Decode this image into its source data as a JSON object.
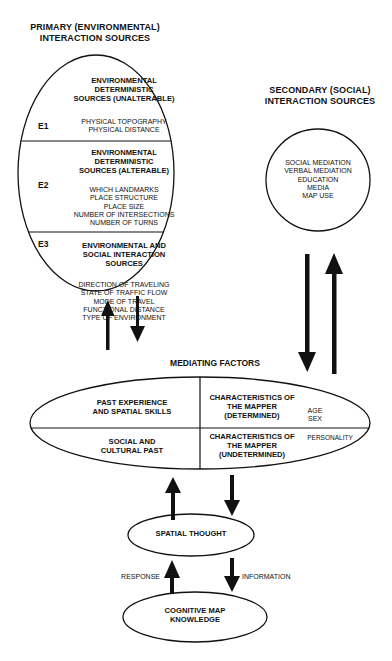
{
  "primary": {
    "title_line1": "PRIMARY (ENVIRONMENTAL)",
    "title_line2": "INTERACTION SOURCES",
    "sections": [
      {
        "id": "E1",
        "heading": [
          "ENVIRONMENTAL",
          "DETERMINISTIC",
          "SOURCES (UNALTERABLE)"
        ],
        "items": [
          "PHYSICAL TOPOGRAPHY",
          "PHYSICAL DISTANCE"
        ]
      },
      {
        "id": "E2",
        "heading": [
          "ENVIRONMENTAL",
          "DETERMINISTIC",
          "SOURCES (ALTERABLE)"
        ],
        "items": [
          "WHICH LANDMARKS",
          "PLACE STRUCTURE",
          "PLACE SIZE",
          "NUMBER OF INTERSECTIONS",
          "NUMBER OF TURNS"
        ]
      },
      {
        "id": "E3",
        "heading": [
          "ENVIRONMENTAL AND",
          "SOCIAL INTERACTION",
          "SOURCES"
        ],
        "items": [
          "DIRECTION OF TRAVELING",
          "STATE OF TRAFFIC FLOW",
          "MODE OF TRAVEL",
          "FUNCTIONAL DISTANCE",
          "TYPE OF ENVIRONMENT"
        ]
      }
    ]
  },
  "secondary": {
    "title_line1": "SECONDARY (SOCIAL)",
    "title_line2": "INTERACTION SOURCES",
    "items": [
      "SOCIAL MEDIATION",
      "VERBAL MEDIATION",
      "EDUCATION",
      "MEDIA",
      "MAP USE"
    ]
  },
  "mediating": {
    "title": "MEDIATING FACTORS",
    "quadrants": {
      "top_left": [
        "PAST EXPERIENCE",
        "AND SPATIAL SKILLS"
      ],
      "bottom_left": [
        "SOCIAL AND",
        "CULTURAL PAST"
      ],
      "top_right": [
        "CHARACTERISTICS OF",
        "THE MAPPER",
        "(DETERMINED)"
      ],
      "top_right_items": [
        "AGE",
        "SEX"
      ],
      "bottom_right": [
        "CHARACTERISTICS OF",
        "THE MAPPER",
        "(UNDETERMINED)"
      ],
      "bottom_right_items": [
        "PERSONALITY"
      ]
    }
  },
  "spatial_thought": {
    "label": "SPATIAL THOUGHT"
  },
  "cognitive_map": {
    "line1": "COGNITIVE MAP",
    "line2": "KNOWLEDGE"
  },
  "arrow_labels": {
    "response": "RESPONSE",
    "information": "INFORMATION"
  },
  "colors": {
    "ink": "#111111",
    "background": "#ffffff"
  }
}
